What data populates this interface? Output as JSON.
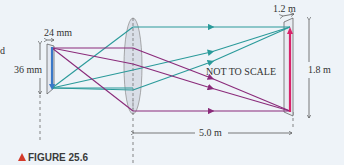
{
  "figure": {
    "caption": "FIGURE 25.6",
    "note": "NOT TO SCALE",
    "left_fragment": "d"
  },
  "dimensions": {
    "film_width": "24 mm",
    "film_height": "36 mm",
    "screen_width": "1.2 m",
    "screen_height": "1.8 m",
    "distance": "5.0 m"
  },
  "colors": {
    "background": "#eef3f8",
    "teal_ray": "#2a9a9a",
    "purple_ray": "#8a2a7a",
    "object_arrow": "#3a78c8",
    "image_arrow": "#d8246a",
    "caption_triangle": "#d43a2a",
    "lens_fill": "#c8ccd8"
  }
}
